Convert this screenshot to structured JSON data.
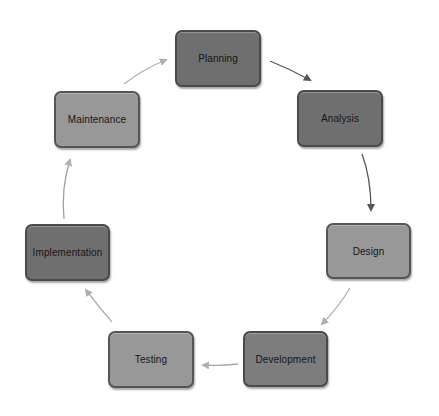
{
  "diagram": {
    "type": "cycle",
    "title": "",
    "nodes": [
      {
        "id": "planning",
        "label": "Planning",
        "tone": "dark",
        "x": 175,
        "y": 30,
        "w": 86,
        "h": 57
      },
      {
        "id": "analysis",
        "label": "Analysis",
        "tone": "dark",
        "x": 297,
        "y": 90,
        "w": 86,
        "h": 57
      },
      {
        "id": "design",
        "label": "Design",
        "tone": "light",
        "x": 326,
        "y": 223,
        "w": 85,
        "h": 56
      },
      {
        "id": "development",
        "label": "Development",
        "tone": "medium",
        "x": 243,
        "y": 331,
        "w": 85,
        "h": 56
      },
      {
        "id": "testing",
        "label": "Testing",
        "tone": "light",
        "x": 108,
        "y": 331,
        "w": 86,
        "h": 57
      },
      {
        "id": "implementation",
        "label": "Implementation",
        "tone": "dark",
        "x": 25,
        "y": 224,
        "w": 85,
        "h": 57
      },
      {
        "id": "maintenance",
        "label": "Maintenance",
        "tone": "light",
        "x": 54,
        "y": 91,
        "w": 86,
        "h": 57
      }
    ],
    "edges": [
      {
        "from": "planning",
        "to": "analysis",
        "color": "#555555"
      },
      {
        "from": "analysis",
        "to": "design",
        "color": "#555555"
      },
      {
        "from": "design",
        "to": "development",
        "color": "#b0b0b0"
      },
      {
        "from": "development",
        "to": "testing",
        "color": "#a8a8a8"
      },
      {
        "from": "testing",
        "to": "implementation",
        "color": "#b0b0b0"
      },
      {
        "from": "implementation",
        "to": "maintenance",
        "color": "#a0a0a0"
      },
      {
        "from": "maintenance",
        "to": "planning",
        "color": "#b0b0b0"
      }
    ],
    "colors": {
      "dark": "#6f6f6f",
      "medium": "#7d7d7d",
      "light": "#989898",
      "border": "#4a4a4a",
      "text": "#161616",
      "background": "#ffffff"
    }
  }
}
